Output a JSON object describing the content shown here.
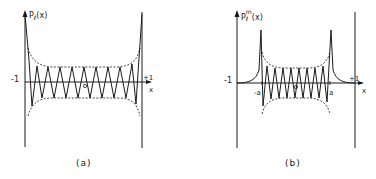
{
  "panels": [
    {
      "id": "a",
      "caption": "(a)",
      "y_label": {
        "main": "P",
        "sub": "ℓ",
        "arg": "(x)"
      },
      "x_label": "x",
      "left_tick": "-1",
      "right_tick": "+1",
      "origin": "0",
      "description": "Legendre polynomial P_l(x) oscillating between -1 and +1 with envelope peaking at the ends"
    },
    {
      "id": "b",
      "caption": "(b)",
      "y_label": {
        "main": "P",
        "sub": "ℓ",
        "sup": "m",
        "arg": "(x)"
      },
      "x_label": "x",
      "left_tick": "-1",
      "right_tick": "+1",
      "inner_left_tick": "-a",
      "inner_right_tick": "a",
      "origin": "0",
      "description": "Associated Legendre function P_l^m(x) oscillating between -a and a, decaying toward ±1"
    }
  ],
  "colors": {
    "ink": "#1a1a1a",
    "background": "#ffffff"
  }
}
